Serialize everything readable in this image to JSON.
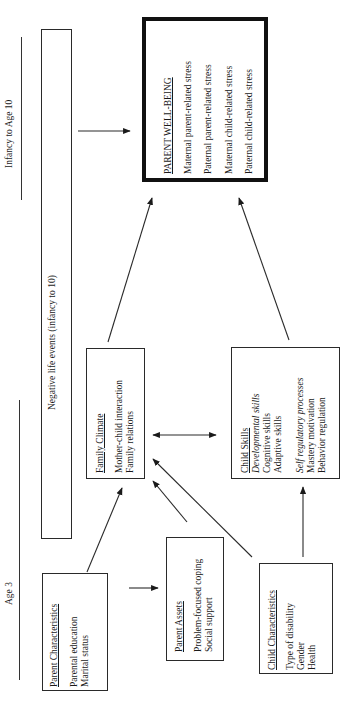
{
  "timeline": {
    "later_label": "Infancy to Age 10",
    "early_label": "Age 3"
  },
  "negative_life_events": {
    "label": "Negative life events (infancy to 10)"
  },
  "parent_well_being": {
    "title": "PARENT WELL-BEING",
    "items": [
      "Maternal parent-related stress",
      "Paternal parent-related stress",
      "Maternal child-related stress",
      "Paternal child-related stress"
    ]
  },
  "family_climate": {
    "title": "Family Climate",
    "items": [
      "Mother-child interaction",
      "Family relations"
    ]
  },
  "child_skills": {
    "title": "Child Skills",
    "group1_heading": "Developmental skills",
    "group1_items": [
      "Cognitive skills",
      "Adaptive skills"
    ],
    "group2_heading": "Self regulatory processes",
    "group2_items": [
      "Mastery motivation",
      "Behavior regulation"
    ]
  },
  "parent_characteristics": {
    "title": "Parent Characteristics",
    "items": [
      "Parental education",
      "Marital status"
    ]
  },
  "parent_assets": {
    "title": "Parent Assets",
    "items": [
      "Problem-focused coping",
      "Social support"
    ]
  },
  "child_characteristics": {
    "title": "Child Characteristics",
    "items": [
      "Type of disability",
      "Gender",
      "Health"
    ]
  },
  "edges": [
    {
      "from": "negative_life_events",
      "to": "parent_well_being"
    },
    {
      "from": "family_climate",
      "to": "parent_well_being"
    },
    {
      "from": "child_skills",
      "to": "parent_well_being"
    },
    {
      "from": "family_climate",
      "to": "child_skills",
      "bidirectional": true
    },
    {
      "from": "parent_characteristics",
      "to": "family_climate"
    },
    {
      "from": "parent_characteristics",
      "to": "parent_assets"
    },
    {
      "from": "parent_assets",
      "to": "family_climate"
    },
    {
      "from": "child_characteristics",
      "to": "family_climate"
    },
    {
      "from": "child_characteristics",
      "to": "child_skills"
    }
  ],
  "colors": {
    "ink": "#1a1a1a",
    "background": "#ffffff"
  }
}
